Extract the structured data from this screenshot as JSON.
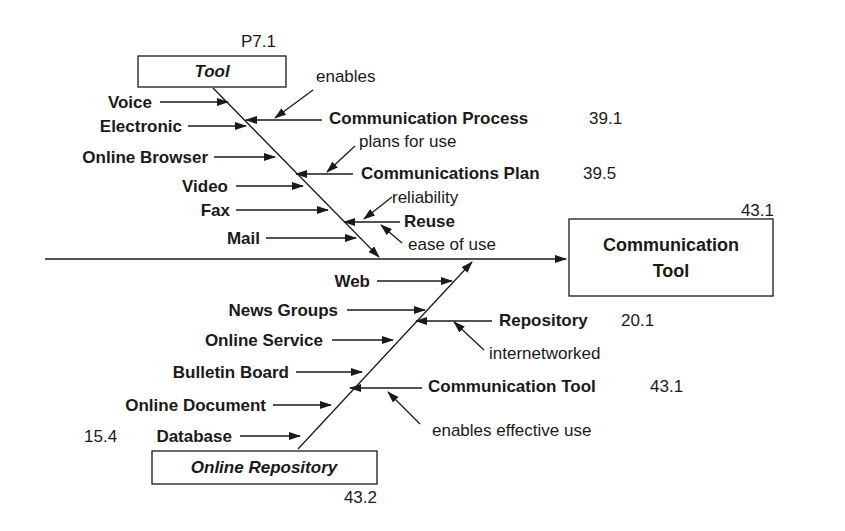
{
  "diagram": {
    "type": "fishbone",
    "effect_box": {
      "label_line1": "Communication",
      "label_line2": "Tool",
      "ref": "43.1"
    },
    "top_category": {
      "label": "Tool",
      "ref": "P7.1",
      "causes": [
        "Voice",
        "Electronic",
        "Online Browser",
        "Video",
        "Fax",
        "Mail"
      ],
      "influences": [
        {
          "label": "Communication Process",
          "ref": "39.1",
          "relation": "enables"
        },
        {
          "label": "Communications Plan",
          "ref": "39.5",
          "relation": "plans for use"
        },
        {
          "label": "Reuse",
          "ref": "",
          "relation_top": "reliability",
          "relation_bottom": "ease of use"
        }
      ]
    },
    "bottom_category": {
      "label": "Online Repository",
      "ref": "43.2",
      "causes": [
        "Web",
        "News Groups",
        "Online Service",
        "Bulletin Board",
        "Online Document",
        "Database"
      ],
      "database_ref": "15.4",
      "influences": [
        {
          "label": "Repository",
          "ref": "20.1",
          "relation": "internetworked"
        },
        {
          "label": "Communication Tool",
          "ref": "43.1",
          "relation": "enables effective use"
        }
      ]
    }
  }
}
